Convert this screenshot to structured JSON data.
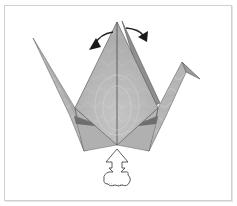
{
  "diagram": {
    "elements": [
      {
        "name": "crane-body",
        "kind": "folded paper kite"
      },
      {
        "name": "left-wing-tail",
        "kind": "pointed flap"
      },
      {
        "name": "right-neck-head",
        "kind": "inside-reverse-folded head"
      },
      {
        "name": "left-curved-arrow",
        "kind": "fold direction arrow"
      },
      {
        "name": "right-curved-arrow",
        "kind": "fold direction arrow"
      },
      {
        "name": "inflate-arrow",
        "kind": "hollow push/blow arrow with puff"
      }
    ],
    "colors": {
      "paper": "#b4b4b4",
      "paper_light": "#c8c8c8",
      "paper_dark": "#8a8a8a",
      "edge": "#555555",
      "arrow": "#222222",
      "frame": "#d0d0d0"
    }
  }
}
